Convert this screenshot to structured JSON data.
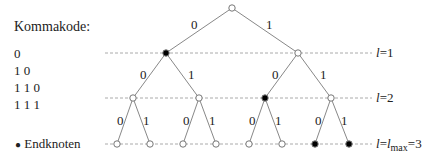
{
  "title": "Kommakode:",
  "codes": [
    "0",
    "1 0",
    "1 1 0",
    "1 1 1"
  ],
  "legend": {
    "symbol": "●",
    "label": "Endknoten"
  },
  "levels": [
    {
      "var": "l",
      "text": "=1"
    },
    {
      "var": "l",
      "text": "=2"
    },
    {
      "var": "l",
      "mid": "=",
      "var2": "l",
      "sub": "max",
      "text": "=3"
    }
  ],
  "edge_labels": {
    "root": [
      "0",
      "1"
    ],
    "l1_left": [
      "0",
      "1"
    ],
    "l1_right": [
      "0",
      "1"
    ],
    "l2_a": [
      "0",
      "1"
    ],
    "l2_b": [
      "0",
      "1"
    ],
    "l2_c": [
      "0",
      "1"
    ]
  },
  "colors": {
    "line": "#888888",
    "dash": "#999999",
    "filled": "#000000",
    "open": "#ffffff"
  }
}
